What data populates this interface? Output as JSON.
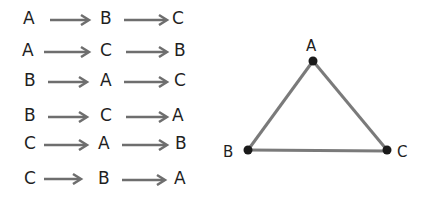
{
  "permutations": {
    "rows": [
      {
        "first": "A",
        "second": "B",
        "third": "C"
      },
      {
        "first": "A",
        "second": "C",
        "third": "B"
      },
      {
        "first": "B",
        "second": "A",
        "third": "C"
      },
      {
        "first": "B",
        "second": "C",
        "third": "A"
      },
      {
        "first": "C",
        "second": "A",
        "third": "B"
      },
      {
        "first": "C",
        "second": "B",
        "third": "A"
      }
    ]
  },
  "graph": {
    "nodes": [
      {
        "id": "A",
        "label": "A"
      },
      {
        "id": "B",
        "label": "B"
      },
      {
        "id": "C",
        "label": "C"
      }
    ],
    "edges": [
      [
        "A",
        "B"
      ],
      [
        "A",
        "C"
      ],
      [
        "B",
        "C"
      ]
    ]
  },
  "colors": {
    "ink": "#1f1f1f",
    "edge": "#7a7a7a",
    "arrow": "#6e6e6e"
  }
}
